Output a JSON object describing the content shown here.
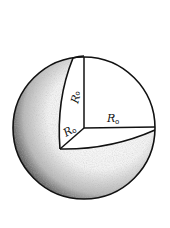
{
  "figure": {
    "labels": {
      "vertical_radius": {
        "main": "R",
        "sub": "o"
      },
      "horizontal_radius": {
        "main": "R",
        "sub": "o"
      },
      "diagonal_radius": {
        "main": "R",
        "sub": "o"
      }
    },
    "colors": {
      "stroke": "#111111",
      "background": "#ffffff",
      "shade_dark": "#2a2a2a",
      "shade_light": "#ffffff"
    }
  }
}
